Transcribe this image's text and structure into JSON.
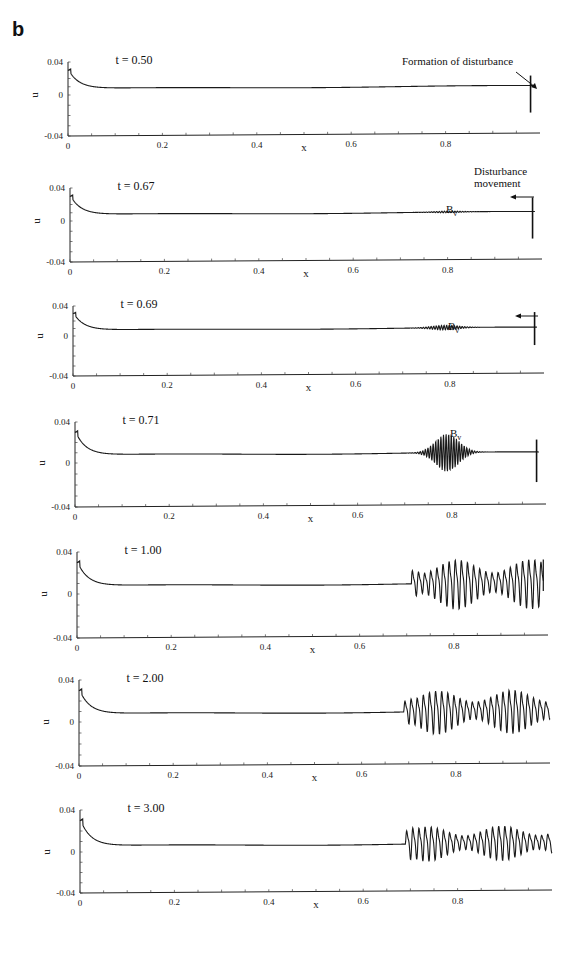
{
  "figure": {
    "panel_letter": "b",
    "annotations": {
      "formation": "Formation of disturbance",
      "movement_line1": "Disturbance",
      "movement_line2": "movement",
      "bv_base": "B",
      "bv_sub": "v"
    }
  },
  "chart_data": [
    {
      "type": "line",
      "title": "t = 0.50",
      "xlabel": "x",
      "ylabel": "u",
      "xlim": [
        0,
        1.0
      ],
      "ylim": [
        -0.04,
        0.04
      ],
      "xticks": [
        "0",
        "0.2",
        "0.4",
        "0.6",
        "0.8"
      ],
      "yticks": [
        "0.04",
        "0",
        "-0.04"
      ],
      "series": [
        {
          "name": "u(x)",
          "baseline": 0.008,
          "initial_peak": 0.032,
          "packet": null,
          "boundary_spike": {
            "x": 0.98,
            "min": -0.02,
            "max": 0.02
          }
        }
      ],
      "annotations": [
        "Formation of disturbance"
      ]
    },
    {
      "type": "line",
      "title": "t = 0.67",
      "xlabel": "x",
      "ylabel": "u",
      "xlim": [
        0,
        1.0
      ],
      "ylim": [
        -0.04,
        0.04
      ],
      "xticks": [
        "0",
        "0.2",
        "0.4",
        "0.6",
        "0.8"
      ],
      "yticks": [
        "0.04",
        "0",
        "-0.04"
      ],
      "series": [
        {
          "name": "u(x)",
          "baseline": 0.008,
          "initial_peak": 0.032,
          "packet": {
            "center": 0.8,
            "width": 0.04,
            "amplitude": 0.001
          },
          "boundary_spike": {
            "x": 0.98,
            "min": -0.02,
            "max": 0.025
          }
        }
      ],
      "annotations": [
        "Disturbance movement",
        "Bv"
      ]
    },
    {
      "type": "line",
      "title": "t = 0.69",
      "xlabel": "x",
      "ylabel": "u",
      "xlim": [
        0,
        1.0
      ],
      "ylim": [
        -0.04,
        0.04
      ],
      "xticks": [
        "0",
        "0.2",
        "0.4",
        "0.6",
        "0.8"
      ],
      "yticks": [
        "0.04",
        "0",
        "-0.04"
      ],
      "series": [
        {
          "name": "u(x)",
          "baseline": 0.008,
          "initial_peak": 0.032,
          "packet": {
            "center": 0.79,
            "width": 0.04,
            "amplitude": 0.003
          },
          "boundary_spike": {
            "x": 0.98,
            "min": -0.012,
            "max": 0.028
          }
        }
      ],
      "annotations": [
        "Bv"
      ]
    },
    {
      "type": "line",
      "title": "t = 0.71",
      "xlabel": "x",
      "ylabel": "u",
      "xlim": [
        0,
        1.0
      ],
      "ylim": [
        -0.04,
        0.04
      ],
      "xticks": [
        "0",
        "0.2",
        "0.4",
        "0.6",
        "0.8"
      ],
      "yticks": [
        "0.04",
        "0",
        "-0.04"
      ],
      "series": [
        {
          "name": "u(x)",
          "baseline": 0.008,
          "initial_peak": 0.032,
          "packet": {
            "center": 0.79,
            "width": 0.035,
            "amplitude": 0.018
          },
          "boundary_spike": {
            "x": 0.98,
            "min": -0.02,
            "max": 0.02
          }
        }
      ],
      "annotations": [
        "Bv"
      ]
    },
    {
      "type": "line",
      "title": "t = 1.00",
      "xlabel": "x",
      "ylabel": "u",
      "xlim": [
        0,
        1.0
      ],
      "ylim": [
        -0.04,
        0.04
      ],
      "xticks": [
        "0",
        "0.2",
        "0.4",
        "0.6",
        "0.8"
      ],
      "yticks": [
        "0.04",
        "0",
        "-0.04"
      ],
      "series": [
        {
          "name": "u(x)",
          "baseline": 0.008,
          "initial_peak": 0.032,
          "oscillation": {
            "start": 0.71,
            "end": 0.99,
            "amplitude": 0.025
          }
        }
      ]
    },
    {
      "type": "line",
      "title": "t = 2.00",
      "xlabel": "x",
      "ylabel": "u",
      "xlim": [
        0,
        1.0
      ],
      "ylim": [
        -0.04,
        0.04
      ],
      "xticks": [
        "0",
        "0.2",
        "0.4",
        "0.6",
        "0.8"
      ],
      "yticks": [
        "0.04",
        "0",
        "-0.04"
      ],
      "series": [
        {
          "name": "u(x)",
          "baseline": 0.008,
          "initial_peak": 0.032,
          "oscillation": {
            "start": 0.69,
            "end": 1.0,
            "amplitude": 0.022
          }
        }
      ]
    },
    {
      "type": "line",
      "title": "t = 3.00",
      "xlabel": "x",
      "ylabel": "u",
      "xlim": [
        0,
        1.0
      ],
      "ylim": [
        -0.04,
        0.04
      ],
      "xticks": [
        "0",
        "0.2",
        "0.4",
        "0.6",
        "0.8"
      ],
      "yticks": [
        "0.04",
        "0",
        "-0.04"
      ],
      "series": [
        {
          "name": "u(x)",
          "baseline": 0.006,
          "initial_peak": 0.032,
          "oscillation": {
            "start": 0.69,
            "end": 1.0,
            "amplitude": 0.018
          }
        }
      ]
    }
  ]
}
